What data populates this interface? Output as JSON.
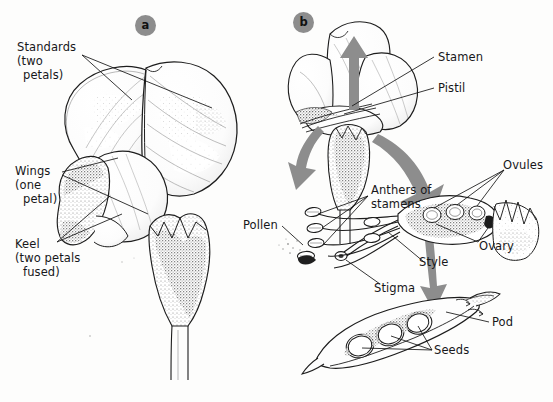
{
  "figure": {
    "background_color": "#fdfdfc",
    "ink_color": "#17171a",
    "arrow_color": "#8d8d8d",
    "badge_color": "#8d8d8d"
  },
  "panels": [
    {
      "id": "a",
      "badge": "a",
      "caption": "Intact pea flower showing petals"
    },
    {
      "id": "b",
      "badge": "b",
      "caption": "Dissected flower showing reproductive parts and pod"
    }
  ],
  "labels": {
    "standards": {
      "lines": [
        "Standards",
        "(two",
        "petals)"
      ]
    },
    "wings": {
      "lines": [
        "Wings",
        "(one",
        "petal)"
      ]
    },
    "keel": {
      "lines": [
        "Keel",
        "(two petals",
        "fused)"
      ]
    },
    "stamen": {
      "lines": [
        "Stamen"
      ]
    },
    "pistil": {
      "lines": [
        "Pistil"
      ]
    },
    "anthers": {
      "lines": [
        "Anthers of",
        "stamens"
      ]
    },
    "pollen": {
      "lines": [
        "Pollen"
      ]
    },
    "ovules": {
      "lines": [
        "Ovules"
      ]
    },
    "ovary": {
      "lines": [
        "Ovary"
      ]
    },
    "style": {
      "lines": [
        "Style"
      ]
    },
    "stigma": {
      "lines": [
        "Stigma"
      ]
    },
    "pod": {
      "lines": [
        "Pod"
      ]
    },
    "seeds": {
      "lines": [
        "Seeds"
      ]
    }
  }
}
